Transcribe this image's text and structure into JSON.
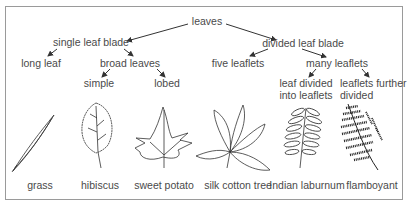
{
  "diagram": {
    "root": "leaves",
    "branches": {
      "single": "single leaf blade",
      "divided": "divided leaf blade"
    },
    "nodes": {
      "long_leaf": "long leaf",
      "broad_leaves": "broad leaves",
      "simple": "simple",
      "lobed": "lobed",
      "five_leaflets": "five leaflets",
      "many_leaflets": "many leaflets",
      "leaf_divided_1": "leaf divided",
      "leaf_divided_2": "into leaflets",
      "further_1": "leaflets further",
      "further_2": "divided"
    },
    "examples": [
      {
        "name": "grass"
      },
      {
        "name": "hibiscus"
      },
      {
        "name": "sweet potato"
      },
      {
        "name": "silk cotton tree"
      },
      {
        "name": "Indian laburnum"
      },
      {
        "name": "flamboyant"
      }
    ],
    "colors": {
      "line": "#333333",
      "text": "#4a4a4a",
      "frame": "#9a9a9a"
    }
  }
}
